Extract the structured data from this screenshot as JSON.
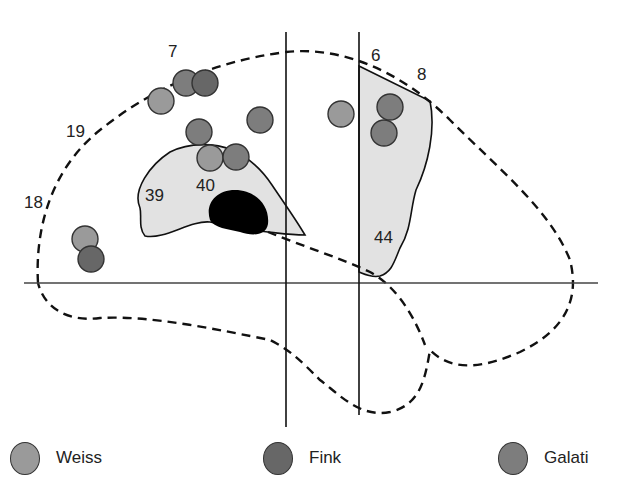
{
  "figure": {
    "regions": [
      {
        "id": "7",
        "label": "7",
        "x": 168,
        "y": 57
      },
      {
        "id": "6",
        "label": "6",
        "x": 371,
        "y": 61
      },
      {
        "id": "8",
        "label": "8",
        "x": 417,
        "y": 80
      },
      {
        "id": "19",
        "label": "19",
        "x": 66,
        "y": 137
      },
      {
        "id": "18",
        "label": "18",
        "x": 24,
        "y": 208
      },
      {
        "id": "39",
        "label": "39",
        "x": 145,
        "y": 201
      },
      {
        "id": "40",
        "label": "40",
        "x": 196,
        "y": 191
      },
      {
        "id": "44",
        "label": "44",
        "x": 374,
        "y": 243
      }
    ],
    "activations": [
      {
        "study": "Weiss",
        "cx": 161,
        "cy": 101
      },
      {
        "study": "Galati",
        "cx": 186,
        "cy": 83
      },
      {
        "study": "Fink",
        "cx": 205,
        "cy": 83
      },
      {
        "study": "Galati",
        "cx": 199,
        "cy": 132
      },
      {
        "study": "Weiss",
        "cx": 210,
        "cy": 158
      },
      {
        "study": "Galati",
        "cx": 236,
        "cy": 157
      },
      {
        "study": "Galati",
        "cx": 260,
        "cy": 120
      },
      {
        "study": "Weiss",
        "cx": 341,
        "cy": 114
      },
      {
        "study": "Galati",
        "cx": 390,
        "cy": 107
      },
      {
        "study": "Galati",
        "cx": 384,
        "cy": 133
      },
      {
        "study": "Weiss",
        "cx": 85,
        "cy": 239
      },
      {
        "study": "Fink",
        "cx": 91,
        "cy": 259
      }
    ]
  },
  "legend": {
    "items": [
      {
        "name": "Weiss",
        "label": "Weiss",
        "color": "#9a9a9a"
      },
      {
        "name": "Fink",
        "label": "Fink",
        "color": "#676767"
      },
      {
        "name": "Galati",
        "label": "Galati",
        "color": "#7d7d7d"
      }
    ]
  },
  "colors": {
    "region_fill": "#e2e2e2",
    "lesion": "#000000",
    "outline": "#111111",
    "axis": "#444444"
  }
}
